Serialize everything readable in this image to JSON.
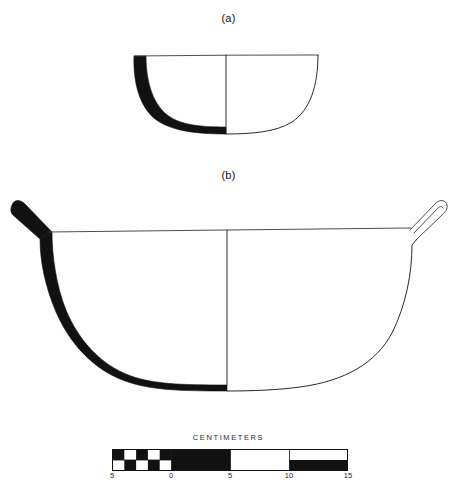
{
  "plate": {
    "background_color": "#fefefe",
    "ink_color": "#111111",
    "outline_color": "#2a2a2a"
  },
  "figures": [
    {
      "label": "(a)",
      "name": "shallow-bowl",
      "description": "shallow hemispherical bowl, left half sectioned solid black, right half exterior profile outline",
      "has_lugs": false
    },
    {
      "label": "(b)",
      "name": "large-bowl-with-lugs",
      "description": "large deep bowl with two upturned lug handles, left half sectioned solid black, right half exterior profile outline",
      "has_lugs": true
    }
  ],
  "labels": {
    "figure_a": "(a)",
    "figure_b": "(b)"
  },
  "scale": {
    "title": "CENTIMETERS",
    "unit": "cm",
    "min": -5,
    "max": 15,
    "tick_labels": [
      "5",
      "0",
      "5",
      "10",
      "15"
    ],
    "tick_values": [
      -5,
      0,
      5,
      10,
      15
    ],
    "left_block_size_cm": 1,
    "right_block_size_cm": 5,
    "bar_colors": [
      "#111111",
      "#ffffff"
    ]
  }
}
